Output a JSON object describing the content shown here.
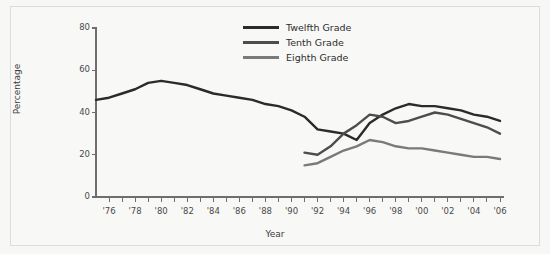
{
  "figure": {
    "background_color": "#f8f8f7",
    "border_color": "#dcdcd8"
  },
  "legend": {
    "position": "top-center",
    "items": [
      {
        "label": "Twelfth Grade",
        "color": "#2b2b2b",
        "swatch_name": "legend-swatch-twelfth"
      },
      {
        "label": "Tenth Grade",
        "color": "#4d4d4d",
        "swatch_name": "legend-swatch-tenth"
      },
      {
        "label": "Eighth Grade",
        "color": "#7a7a7a",
        "swatch_name": "legend-swatch-eighth"
      }
    ]
  },
  "axes": {
    "ytitle": "Percentage",
    "xtitle": "Year",
    "yticks": [
      "0",
      "20",
      "40",
      "60",
      "80"
    ],
    "xticks": [
      "'76",
      "'78",
      "'80",
      "'82",
      "'84",
      "'86",
      "'88",
      "'90",
      "'92",
      "'94",
      "'96",
      "'98",
      "'00",
      "'02",
      "'04",
      "'06"
    ]
  },
  "chart_data": {
    "type": "line",
    "title": "",
    "xlabel": "Year",
    "ylabel": "Percentage",
    "xlim": [
      1975,
      2006
    ],
    "ylim": [
      0,
      80
    ],
    "grid": false,
    "legend_position": "top-center",
    "xtick_values": [
      1976,
      1978,
      1980,
      1982,
      1984,
      1986,
      1988,
      1990,
      1992,
      1994,
      1996,
      1998,
      2000,
      2002,
      2004,
      2006
    ],
    "xtick_labels": [
      "'76",
      "'78",
      "'80",
      "'82",
      "'84",
      "'86",
      "'88",
      "'90",
      "'92",
      "'94",
      "'96",
      "'98",
      "'00",
      "'02",
      "'04",
      "'06"
    ],
    "ytick_values": [
      0,
      20,
      40,
      60,
      80
    ],
    "ytick_labels": [
      "0",
      "20",
      "40",
      "60",
      "80"
    ],
    "minor_xticks_every": 1,
    "series": [
      {
        "name": "Twelfth Grade",
        "color": "#2b2b2b",
        "x": [
          1975,
          1976,
          1977,
          1978,
          1979,
          1980,
          1981,
          1982,
          1983,
          1984,
          1985,
          1986,
          1987,
          1988,
          1989,
          1990,
          1991,
          1992,
          1993,
          1994,
          1995,
          1996,
          1997,
          1998,
          1999,
          2000,
          2001,
          2002,
          2003,
          2004,
          2005,
          2006
        ],
        "values": [
          46,
          47,
          49,
          51,
          54,
          55,
          54,
          53,
          51,
          49,
          48,
          47,
          46,
          44,
          43,
          41,
          38,
          32,
          31,
          30,
          27,
          35,
          39,
          42,
          44,
          43,
          43,
          42,
          41,
          39,
          38,
          36
        ]
      },
      {
        "name": "Tenth Grade",
        "color": "#4d4d4d",
        "x": [
          1991,
          1992,
          1993,
          1994,
          1995,
          1996,
          1997,
          1998,
          1999,
          2000,
          2001,
          2002,
          2003,
          2004,
          2005,
          2006
        ],
        "values": [
          21,
          20,
          24,
          30,
          34,
          39,
          38,
          35,
          36,
          38,
          40,
          39,
          37,
          35,
          33,
          30
        ]
      },
      {
        "name": "Eighth Grade",
        "color": "#7a7a7a",
        "x": [
          1991,
          1992,
          1993,
          1994,
          1995,
          1996,
          1997,
          1998,
          1999,
          2000,
          2001,
          2002,
          2003,
          2004,
          2005,
          2006
        ],
        "values": [
          15,
          16,
          19,
          22,
          24,
          27,
          26,
          24,
          23,
          23,
          22,
          21,
          20,
          19,
          19,
          18
        ]
      }
    ]
  }
}
